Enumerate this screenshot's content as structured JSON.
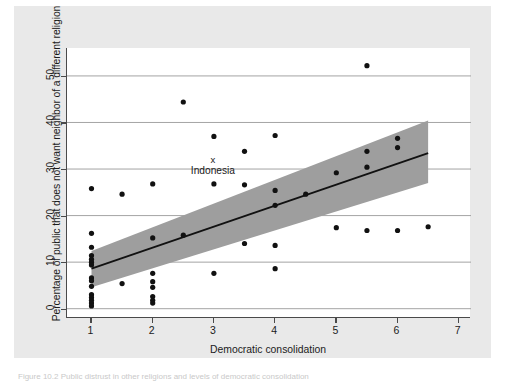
{
  "figure": {
    "background_color": "#e9e9e9",
    "plot_background_color": "#ffffff",
    "caption": "Figure 10.2 Public distrust in other religions and levels of democratic consolidation"
  },
  "chart_data": {
    "type": "scatter",
    "title": "",
    "xlabel": "Democratic consolidation",
    "ylabel": "Percentage of public that does not want neighbor of a different religion",
    "xlim": [
      0.6,
      7.2
    ],
    "ylim": [
      -2,
      56
    ],
    "xticks": [
      1,
      2,
      3,
      4,
      5,
      6,
      7
    ],
    "yticks": [
      0,
      10,
      20,
      30,
      40,
      50
    ],
    "grid": "horizontal",
    "grid_color": "#9a9a9a",
    "marker_color": "#111111",
    "trend_line_color": "#111111",
    "confidence_band_color": "#9e9e9e",
    "points": [
      {
        "x": 1.0,
        "y": 25.8
      },
      {
        "x": 1.0,
        "y": 16.2
      },
      {
        "x": 1.0,
        "y": 13.2
      },
      {
        "x": 1.0,
        "y": 11.4
      },
      {
        "x": 1.0,
        "y": 10.6
      },
      {
        "x": 1.0,
        "y": 10.0
      },
      {
        "x": 1.0,
        "y": 9.4
      },
      {
        "x": 1.0,
        "y": 6.6
      },
      {
        "x": 1.0,
        "y": 6.0
      },
      {
        "x": 1.0,
        "y": 4.8
      },
      {
        "x": 1.0,
        "y": 3.0
      },
      {
        "x": 1.0,
        "y": 2.4
      },
      {
        "x": 1.0,
        "y": 1.8
      },
      {
        "x": 1.0,
        "y": 1.2
      },
      {
        "x": 1.0,
        "y": 0.6
      },
      {
        "x": 1.5,
        "y": 24.6
      },
      {
        "x": 1.5,
        "y": 5.4
      },
      {
        "x": 2.0,
        "y": 26.8
      },
      {
        "x": 2.0,
        "y": 15.2
      },
      {
        "x": 2.0,
        "y": 7.6
      },
      {
        "x": 2.0,
        "y": 5.8
      },
      {
        "x": 2.0,
        "y": 4.6
      },
      {
        "x": 2.0,
        "y": 2.6
      },
      {
        "x": 2.0,
        "y": 1.8
      },
      {
        "x": 2.0,
        "y": 1.2
      },
      {
        "x": 2.5,
        "y": 44.4
      },
      {
        "x": 2.5,
        "y": 15.8
      },
      {
        "x": 3.0,
        "y": 37.0
      },
      {
        "x": 3.0,
        "y": 26.8
      },
      {
        "x": 3.0,
        "y": 7.6
      },
      {
        "x": 3.5,
        "y": 33.8
      },
      {
        "x": 3.5,
        "y": 26.6
      },
      {
        "x": 3.5,
        "y": 14.0
      },
      {
        "x": 4.0,
        "y": 37.2
      },
      {
        "x": 4.0,
        "y": 25.4
      },
      {
        "x": 4.0,
        "y": 22.2
      },
      {
        "x": 4.0,
        "y": 13.6
      },
      {
        "x": 4.0,
        "y": 8.6
      },
      {
        "x": 4.5,
        "y": 24.6
      },
      {
        "x": 5.0,
        "y": 29.2
      },
      {
        "x": 5.0,
        "y": 17.4
      },
      {
        "x": 5.5,
        "y": 52.2
      },
      {
        "x": 5.5,
        "y": 33.8
      },
      {
        "x": 5.5,
        "y": 30.4
      },
      {
        "x": 5.5,
        "y": 16.8
      },
      {
        "x": 6.0,
        "y": 36.6
      },
      {
        "x": 6.0,
        "y": 34.6
      },
      {
        "x": 6.0,
        "y": 16.8
      },
      {
        "x": 6.5,
        "y": 17.6
      }
    ],
    "trend_line": {
      "x_start": 1.0,
      "y_start": 8.6,
      "x_end": 6.5,
      "y_end": 33.4
    },
    "confidence_band": {
      "x_start": 1.0,
      "x_end": 6.5,
      "upper_start": 12.4,
      "upper_end": 40.4,
      "lower_start": 4.6,
      "lower_end": 27.0
    },
    "annotations": [
      {
        "marker": "x",
        "label": "Indonesia",
        "x": 3.0,
        "y": 32.0
      }
    ]
  },
  "axes": {
    "x_tick_labels": [
      "1",
      "2",
      "3",
      "4",
      "5",
      "6",
      "7"
    ],
    "y_tick_labels": [
      "0",
      "10",
      "20",
      "30",
      "40",
      "50"
    ]
  }
}
